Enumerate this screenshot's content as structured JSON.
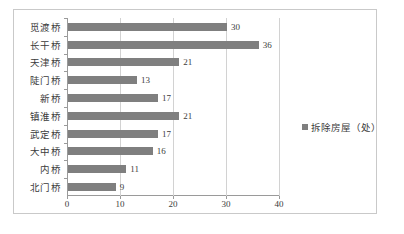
{
  "chart_data": {
    "type": "bar",
    "orientation": "horizontal",
    "title": "",
    "xlabel": "",
    "ylabel": "",
    "xlim": [
      0,
      40
    ],
    "xticks": [
      0,
      10,
      20,
      30,
      40
    ],
    "grid": true,
    "legend_position": "right",
    "series": [
      {
        "name": "拆除房屋（处）",
        "color": "#7f7f7f"
      }
    ],
    "categories": [
      "觅渡桥",
      "长干桥",
      "天津桥",
      "陡门桥",
      "新桥",
      "镇淮桥",
      "武定桥",
      "大中桥",
      "内桥",
      "北门桥"
    ],
    "values": [
      30,
      36,
      21,
      13,
      17,
      21,
      17,
      16,
      11,
      9
    ],
    "data_labels": [
      "30",
      "36",
      "21",
      "13",
      "17",
      "21",
      "17",
      "16",
      "11",
      "9"
    ]
  },
  "legend": {
    "label": "拆除房屋（处）",
    "swatch_color": "#7f7f7f"
  },
  "axis": {
    "x_tick_labels": [
      "0",
      "10",
      "20",
      "30",
      "40"
    ]
  }
}
